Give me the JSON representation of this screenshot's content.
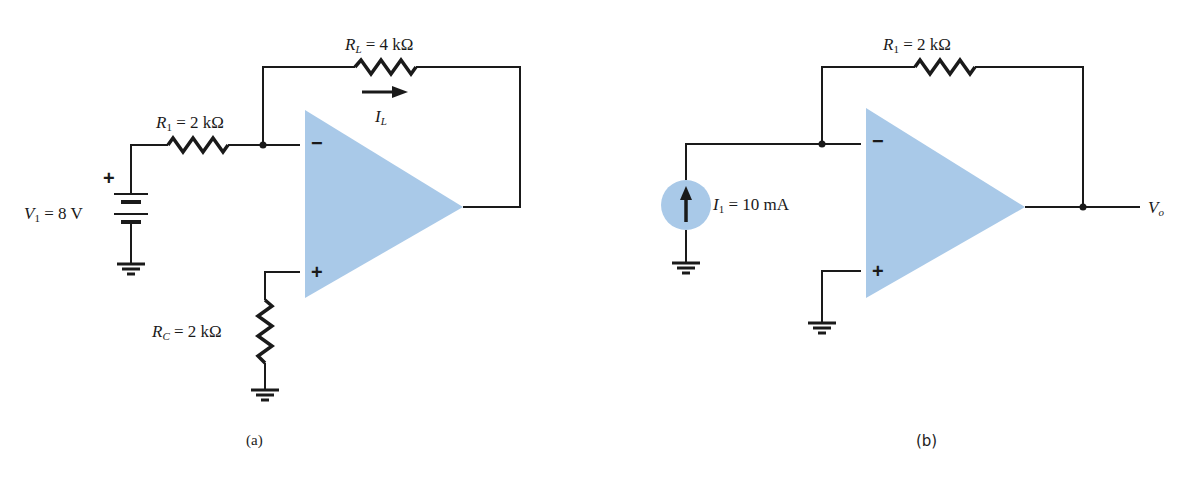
{
  "colors": {
    "opamp_fill": "#a9c9e8",
    "source_fill": "#a9c9e8",
    "wire": "#1a1a1a",
    "background": "#ffffff"
  },
  "figure_a": {
    "caption": "(a)",
    "resistor_load": {
      "symbol": "R",
      "subscript": "L",
      "value": "= 4 kΩ"
    },
    "resistor_input": {
      "symbol": "R",
      "subscript": "1",
      "value": "= 2 kΩ"
    },
    "resistor_comp": {
      "symbol": "R",
      "subscript": "C",
      "value": "= 2 kΩ"
    },
    "voltage_source": {
      "symbol": "V",
      "subscript": "1",
      "value": "= 8 V",
      "polarity": "+"
    },
    "current_label": {
      "symbol": "I",
      "subscript": "L"
    },
    "opamp": {
      "inverting": "−",
      "noninverting": "+"
    }
  },
  "figure_b": {
    "caption": "(b)",
    "resistor_feedback": {
      "symbol": "R",
      "subscript": "1",
      "value": "= 2 kΩ"
    },
    "current_source": {
      "symbol": "I",
      "subscript": "1",
      "value": "= 10 mA"
    },
    "output_label": {
      "symbol": "V",
      "subscript": "o"
    },
    "opamp": {
      "inverting": "−",
      "noninverting": "+"
    }
  }
}
